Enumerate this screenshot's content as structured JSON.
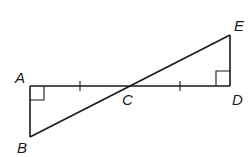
{
  "figure": {
    "points": {
      "A": {
        "label": "A",
        "x": 30,
        "y": 86
      },
      "B": {
        "label": "B",
        "x": 30,
        "y": 137
      },
      "C": {
        "label": "C",
        "x": 128,
        "y": 86
      },
      "D": {
        "label": "D",
        "x": 230,
        "y": 86
      },
      "E": {
        "label": "E",
        "x": 230,
        "y": 35
      }
    },
    "segments": [
      "AD",
      "AB",
      "BE",
      "DE"
    ],
    "right_angles": [
      "A",
      "D"
    ],
    "congruence_ticks": [
      "AC",
      "CD"
    ],
    "line_color": "#1a1a1a"
  }
}
